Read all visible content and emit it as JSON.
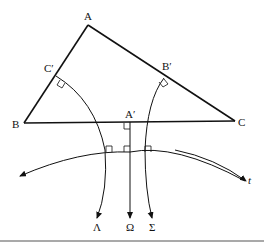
{
  "diagram": {
    "vertices": {
      "A": {
        "label": "A",
        "x": 88,
        "y": 25
      },
      "B": {
        "label": "B",
        "x": 24,
        "y": 123
      },
      "C": {
        "label": "C",
        "x": 235,
        "y": 121
      }
    },
    "feet": {
      "C_prime": {
        "label": "C′",
        "x": 56,
        "y": 76
      },
      "B_prime": {
        "label": "B′",
        "x": 164,
        "y": 78
      },
      "A_prime": {
        "label": "A′",
        "x": 130,
        "y": 122
      }
    },
    "curve_labels": {
      "lambda": "Λ",
      "omega": "Ω",
      "sigma": "Σ",
      "t": "t"
    },
    "colors": {
      "stroke": "#111111",
      "background": "#ffffff",
      "rule": "#555555"
    }
  }
}
